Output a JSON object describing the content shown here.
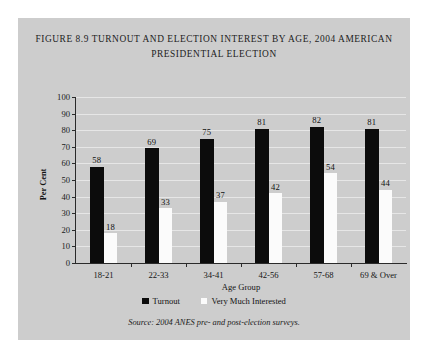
{
  "figure": {
    "title_lines": [
      "Figure 8.9 Turnout and Election Interest by Age, 2004 American",
      "Presidential Election"
    ],
    "source_note": "Source: 2004 ANES pre- and post-election surveys.",
    "panel_bg": "#cdcdcd"
  },
  "chart_data": {
    "type": "bar",
    "title": "Figure 8.9 Turnout and Election Interest by Age, 2004 American Presidential Election",
    "xlabel": "Age Group",
    "ylabel": "Per Cent",
    "ylim": [
      0,
      100
    ],
    "ytick_step": 10,
    "yticks": [
      "100",
      "90",
      "80",
      "70",
      "60",
      "50",
      "40",
      "30",
      "20",
      "10",
      "0"
    ],
    "grid": true,
    "legend_position": "bottom",
    "categories": [
      "18-21",
      "22-33",
      "34-41",
      "42-56",
      "57-68",
      "69 & Over"
    ],
    "series": [
      {
        "name": "Turnout",
        "color": "#0c0c0c",
        "values": [
          58,
          69,
          75,
          81,
          82,
          81
        ]
      },
      {
        "name": "Very Much Interested",
        "color": "#fbfbfb",
        "values": [
          18,
          33,
          37,
          42,
          54,
          44
        ]
      }
    ]
  }
}
